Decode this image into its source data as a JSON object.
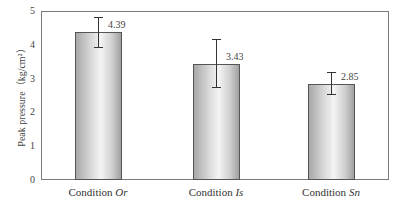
{
  "chart_data": {
    "type": "bar",
    "title": "",
    "xlabel": "",
    "ylabel": "Peak pressure（kg/cm²）",
    "ylim": [
      0,
      5
    ],
    "yticks": [
      0,
      1,
      2,
      3,
      4,
      5
    ],
    "grid": false,
    "legend": null,
    "categories": [
      "Condition Or",
      "Condition Is",
      "Condition Sn"
    ],
    "category_prefix": "Condition",
    "category_suffix_italic": [
      "Or",
      "Is",
      "Sn"
    ],
    "values": [
      4.39,
      3.43,
      2.85
    ],
    "value_labels": [
      "4.39",
      "3.43",
      "2.85"
    ],
    "error_bars": [
      {
        "upper": 4.83,
        "lower": 3.93
      },
      {
        "upper": 4.16,
        "lower": 2.74
      },
      {
        "upper": 3.21,
        "lower": 2.54
      }
    ]
  },
  "axis": {
    "ylabel": "Peak pressure（kg/cm²）",
    "ticks": [
      "0",
      "1",
      "2",
      "3",
      "4",
      "5"
    ]
  },
  "colors": {
    "bar_edge": "#555555",
    "bar_fill_light": "#f4f4f4",
    "bar_fill_dark": "#a0a0a0",
    "frame": "#7a7a7a"
  }
}
